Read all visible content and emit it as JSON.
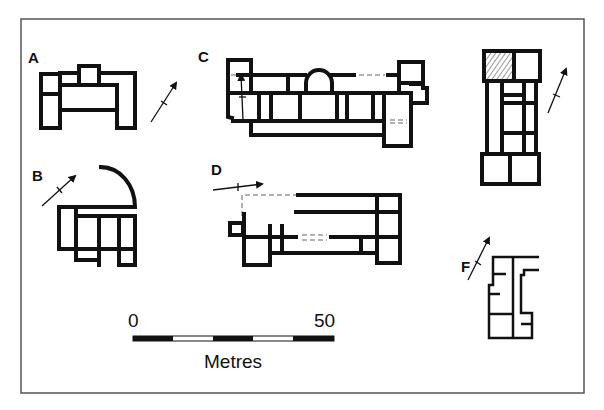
{
  "figure": {
    "plans": [
      {
        "id": "A",
        "label": "A"
      },
      {
        "id": "B",
        "label": "B"
      },
      {
        "id": "C",
        "label": "C"
      },
      {
        "id": "D",
        "label": "D"
      },
      {
        "id": "E",
        "label": "E"
      },
      {
        "id": "F",
        "label": "F"
      }
    ],
    "scale_bar": {
      "start_label": "0",
      "end_label": "50",
      "unit_label": "Metres",
      "segments": 5
    },
    "colors": {
      "line": "#111111",
      "frame": "#555555",
      "dashed": "#999999",
      "background": "#ffffff"
    }
  }
}
